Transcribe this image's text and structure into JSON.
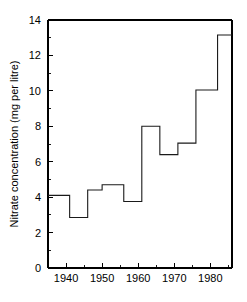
{
  "chart_data": {
    "type": "line",
    "subtype": "step",
    "title": "",
    "subtitle": "",
    "xlabel": "",
    "ylabel": "Nitrate concentration (mg per litre)",
    "xlim": [
      1935,
      1986
    ],
    "ylim": [
      0,
      14
    ],
    "grid": false,
    "legend": null,
    "x_ticks_major": [
      1940,
      1950,
      1960,
      1970,
      1980
    ],
    "x_tick_labels": [
      "1940",
      "1950",
      "1960",
      "1970",
      "1980"
    ],
    "x_ticks_minor": [
      1945,
      1955,
      1965,
      1975,
      1985
    ],
    "y_ticks_major": [
      0,
      2,
      4,
      6,
      8,
      10,
      12,
      14
    ],
    "y_tick_labels": [
      "0",
      "2",
      "4",
      "6",
      "8",
      "10",
      "12",
      "14"
    ],
    "y_ticks_minor": [
      1,
      3,
      5,
      7,
      9,
      11,
      13
    ],
    "line_color": "#1a1a1a",
    "steps": [
      {
        "x_start": 1935,
        "x_end": 1941,
        "value": 4.1
      },
      {
        "x_start": 1941,
        "x_end": 1946,
        "value": 2.85
      },
      {
        "x_start": 1946,
        "x_end": 1950,
        "value": 4.4
      },
      {
        "x_start": 1950,
        "x_end": 1956,
        "value": 4.7
      },
      {
        "x_start": 1956,
        "x_end": 1961,
        "value": 3.75
      },
      {
        "x_start": 1961,
        "x_end": 1966,
        "value": 8.0
      },
      {
        "x_start": 1966,
        "x_end": 1971,
        "value": 6.4
      },
      {
        "x_start": 1971,
        "x_end": 1976,
        "value": 7.05
      },
      {
        "x_start": 1976,
        "x_end": 1982,
        "value": 10.05
      },
      {
        "x_start": 1982,
        "x_end": 1986,
        "value": 13.15
      }
    ],
    "x": [
      1935,
      1941,
      1946,
      1950,
      1956,
      1961,
      1966,
      1971,
      1976,
      1982
    ],
    "values": [
      4.1,
      2.85,
      4.4,
      4.7,
      3.75,
      8.0,
      6.4,
      7.05,
      10.05,
      13.15
    ]
  }
}
